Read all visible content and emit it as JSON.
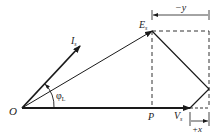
{
  "diagram": {
    "type": "phasor-diagram",
    "colors": {
      "line": "#1a1a1a",
      "dashed": "#333333",
      "background": "#ffffff"
    },
    "labels": {
      "origin": "O",
      "current": "I",
      "current_sub": "s",
      "emf": "E",
      "emf_sub": "s",
      "voltage": "V",
      "voltage_sub": "s",
      "projection_point": "P",
      "angle": "φ",
      "angle_sub": "L",
      "dim_top": "−y",
      "dim_bottom": "+x"
    }
  }
}
